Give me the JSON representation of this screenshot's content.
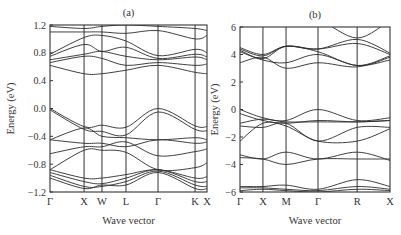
{
  "figure": {
    "background": "#ffffff",
    "line_color": "#2a2a2a",
    "frame_color": "#333333"
  },
  "chart_data": [
    {
      "type": "line",
      "panel_label": "(a)",
      "title": "(a)",
      "xlabel": "Wave vector",
      "ylabel": "Energy (eV)",
      "ylim": [
        -1.2,
        1.2
      ],
      "yticks": [
        "1.2",
        "0.8",
        "0.4",
        "0.0",
        "-0.4",
        "-0.8",
        "-1.2"
      ],
      "ytick_values": [
        1.2,
        0.8,
        0.4,
        0.0,
        -0.4,
        -0.8,
        -1.2
      ],
      "kpoints": [
        "Γ",
        "X",
        "W",
        "L",
        "Γ",
        "K",
        "X"
      ],
      "kpoint_positions": [
        0,
        0.217,
        0.331,
        0.484,
        0.688,
        0.924,
        1.0
      ],
      "grid": false,
      "series_note": "Electronic bands sampled at k-path fractions x",
      "x": [
        0,
        0.217,
        0.331,
        0.484,
        0.688,
        0.924,
        1.0
      ],
      "series": [
        {
          "name": "cb1",
          "values": [
            0.62,
            0.5,
            0.5,
            0.55,
            0.62,
            0.52,
            0.5
          ]
        },
        {
          "name": "cb2",
          "values": [
            0.66,
            0.75,
            0.72,
            0.62,
            0.66,
            0.62,
            0.64
          ]
        },
        {
          "name": "cb3",
          "values": [
            0.7,
            0.78,
            0.82,
            0.75,
            0.7,
            0.74,
            0.7
          ]
        },
        {
          "name": "cb4",
          "values": [
            0.75,
            0.92,
            0.82,
            0.88,
            0.72,
            0.78,
            0.74
          ]
        },
        {
          "name": "cb5",
          "values": [
            0.78,
            1.02,
            1.05,
            0.97,
            0.76,
            0.85,
            0.8
          ]
        },
        {
          "name": "cb6",
          "values": [
            1.1,
            1.1,
            1.1,
            1.08,
            1.12,
            1.0,
            1.05
          ]
        },
        {
          "name": "cb7",
          "values": [
            1.18,
            1.15,
            1.18,
            1.2,
            1.18,
            1.15,
            1.12
          ]
        },
        {
          "name": "vb1",
          "values": [
            0.0,
            -0.26,
            -0.24,
            -0.27,
            0.0,
            -0.25,
            -0.26
          ]
        },
        {
          "name": "vb2",
          "values": [
            -0.02,
            -0.3,
            -0.33,
            -0.38,
            -0.05,
            -0.3,
            -0.32
          ]
        },
        {
          "name": "vb3",
          "values": [
            -0.45,
            -0.28,
            -0.4,
            -0.42,
            -0.45,
            -0.42,
            -0.45
          ]
        },
        {
          "name": "vb4",
          "values": [
            -0.45,
            -0.5,
            -0.5,
            -0.55,
            -0.45,
            -0.5,
            -0.48
          ]
        },
        {
          "name": "vb5",
          "values": [
            -0.65,
            -0.55,
            -0.55,
            -0.48,
            -0.68,
            -0.62,
            -0.58
          ]
        },
        {
          "name": "vb6",
          "values": [
            -0.88,
            -0.6,
            -0.6,
            -0.63,
            -0.88,
            -0.85,
            -0.78
          ]
        },
        {
          "name": "vb7",
          "values": [
            -0.88,
            -1.0,
            -1.0,
            -0.95,
            -0.88,
            -1.0,
            -0.98
          ]
        },
        {
          "name": "vb8",
          "values": [
            -0.92,
            -1.05,
            -1.08,
            -1.0,
            -0.88,
            -1.05,
            -1.05
          ]
        },
        {
          "name": "vb9",
          "values": [
            -0.96,
            -1.12,
            -1.12,
            -1.05,
            -0.9,
            -1.1,
            -1.12
          ]
        },
        {
          "name": "vb10",
          "values": [
            -1.0,
            -1.15,
            -1.1,
            -1.1,
            -0.92,
            -1.15,
            -1.15
          ]
        }
      ]
    },
    {
      "type": "line",
      "panel_label": "(b)",
      "title": "(b)",
      "xlabel": "Wave vector",
      "ylabel": "Energy (eV)",
      "ylim": [
        -6,
        6
      ],
      "yticks": [
        "6",
        "4",
        "2",
        "0",
        "-2",
        "-4",
        "-6"
      ],
      "ytick_values": [
        6,
        4,
        2,
        0,
        -2,
        -4,
        -6
      ],
      "kpoints": [
        "Γ",
        "X",
        "M",
        "Γ",
        "R",
        "X"
      ],
      "kpoint_positions": [
        0,
        0.153,
        0.307,
        0.52,
        0.781,
        1.0
      ],
      "grid": false,
      "x": [
        0,
        0.153,
        0.307,
        0.52,
        0.781,
        1.0
      ],
      "series": [
        {
          "name": "cb1",
          "values": [
            3.4,
            3.8,
            3.0,
            3.4,
            3.1,
            3.8
          ]
        },
        {
          "name": "cb2",
          "values": [
            4.2,
            3.6,
            3.4,
            4.0,
            3.2,
            3.6
          ]
        },
        {
          "name": "cb3",
          "values": [
            4.3,
            3.7,
            4.6,
            4.2,
            3.2,
            3.9
          ]
        },
        {
          "name": "cb4",
          "values": [
            4.4,
            3.9,
            4.6,
            4.4,
            4.8,
            4.0
          ]
        },
        {
          "name": "cb5",
          "values": [
            4.5,
            4.0,
            4.6,
            4.4,
            5.1,
            4.1
          ]
        },
        {
          "name": "cb6",
          "values": [
            6.5,
            6.5,
            6.5,
            6.5,
            5.2,
            6.5
          ]
        },
        {
          "name": "vb1",
          "values": [
            0.0,
            -0.6,
            -0.8,
            0.0,
            -0.8,
            -0.6
          ]
        },
        {
          "name": "vb2",
          "values": [
            -0.3,
            -0.8,
            -1.0,
            -0.8,
            -0.9,
            -0.8
          ]
        },
        {
          "name": "vb3",
          "values": [
            -1.0,
            -0.7,
            -0.9,
            -0.9,
            -0.9,
            -0.8
          ]
        },
        {
          "name": "vb4",
          "values": [
            -1.2,
            -1.3,
            -1.0,
            -2.3,
            -1.3,
            -1.3
          ]
        },
        {
          "name": "vb5",
          "values": [
            -2.3,
            -1.0,
            -1.2,
            -2.3,
            -2.3,
            -1.4
          ]
        },
        {
          "name": "vb6",
          "values": [
            -3.3,
            -3.6,
            -3.1,
            -3.6,
            -3.1,
            -3.7
          ]
        },
        {
          "name": "vb7",
          "values": [
            -3.5,
            -3.6,
            -4.0,
            -3.6,
            -3.6,
            -3.6
          ]
        },
        {
          "name": "vb8",
          "values": [
            -5.6,
            -5.6,
            -5.5,
            -5.8,
            -5.1,
            -5.6
          ]
        },
        {
          "name": "vb9",
          "values": [
            -5.7,
            -5.7,
            -5.8,
            -5.9,
            -5.6,
            -5.8
          ]
        },
        {
          "name": "vb10",
          "values": [
            -5.9,
            -5.8,
            -5.9,
            -6.0,
            -5.8,
            -5.9
          ]
        }
      ]
    }
  ],
  "layout": {
    "panels": [
      {
        "left": 50,
        "right": 207,
        "top": 25,
        "bottom": 192
      },
      {
        "left": 240,
        "right": 390,
        "top": 27,
        "bottom": 192
      }
    ]
  }
}
